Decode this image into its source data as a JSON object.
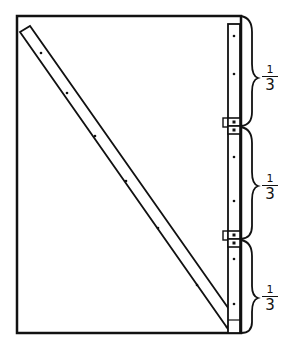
{
  "diagram": {
    "type": "construction-illustration",
    "colors": {
      "line": "#111111",
      "background": "#ffffff"
    },
    "sections": [
      {
        "numerator": "1",
        "denominator": "3"
      },
      {
        "numerator": "1",
        "denominator": "3"
      },
      {
        "numerator": "1",
        "denominator": "3"
      }
    ],
    "hinge_count": 2
  }
}
